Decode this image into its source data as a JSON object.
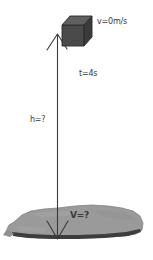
{
  "diagram": {
    "background_color": "#ffffff",
    "labels": {
      "initial_velocity": "v=0m/s",
      "time": "t=4s",
      "height": "h=?",
      "final_velocity": "V=?"
    },
    "objects": {
      "falling_block": {
        "name": "cube",
        "fill_color": "#4a4a4a",
        "top_face_color": "#5f5f5f",
        "side_face_color": "#3c3c3c",
        "outline_color": "#2a2a2a"
      },
      "ground": {
        "name": "ground-slab",
        "fill_color": "#9a9a9a",
        "edge_color": "#3d3d3d",
        "outline_color": "#7a7a7a"
      },
      "arrow": {
        "name": "height-arrow",
        "color": "#3a3a3a",
        "direction": "double-headed-vertical"
      }
    }
  }
}
